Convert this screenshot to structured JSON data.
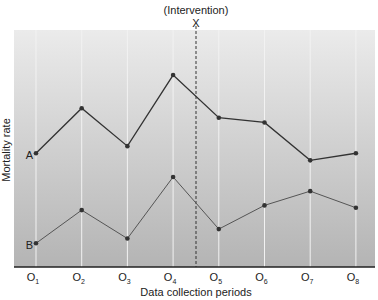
{
  "chart_data": {
    "type": "line",
    "title": "",
    "annotation": {
      "label": "(Intervention)",
      "marker": "X",
      "position_between": [
        "O4",
        "O5"
      ],
      "line_style": "dashed"
    },
    "xlabel": "Data collection periods",
    "ylabel": "Mortality rate",
    "categories": [
      "O1",
      "O2",
      "O3",
      "O4",
      "O5",
      "O6",
      "O7",
      "O8"
    ],
    "category_labels": [
      {
        "base": "O",
        "sub": "1"
      },
      {
        "base": "O",
        "sub": "2"
      },
      {
        "base": "O",
        "sub": "3"
      },
      {
        "base": "O",
        "sub": "4"
      },
      {
        "base": "O",
        "sub": "5"
      },
      {
        "base": "O",
        "sub": "6"
      },
      {
        "base": "O",
        "sub": "7"
      },
      {
        "base": "O",
        "sub": "8"
      }
    ],
    "series": [
      {
        "name": "A",
        "values": [
          48,
          67,
          51,
          81,
          63,
          61,
          45,
          48
        ]
      },
      {
        "name": "B",
        "values": [
          10,
          24,
          12,
          38,
          16,
          26,
          32,
          25
        ]
      }
    ],
    "ylim": [
      0,
      100
    ],
    "y_ticks_shown": false,
    "grid": {
      "vertical": true,
      "horizontal": false
    },
    "legend": "inline labels at start of each series",
    "colors": {
      "background_top": "#ebebeb",
      "background_bottom": "#b4b4b4",
      "grid": "#f2f2f2",
      "line_A": "#333333",
      "line_B": "#555555",
      "axis": "#222222"
    }
  }
}
